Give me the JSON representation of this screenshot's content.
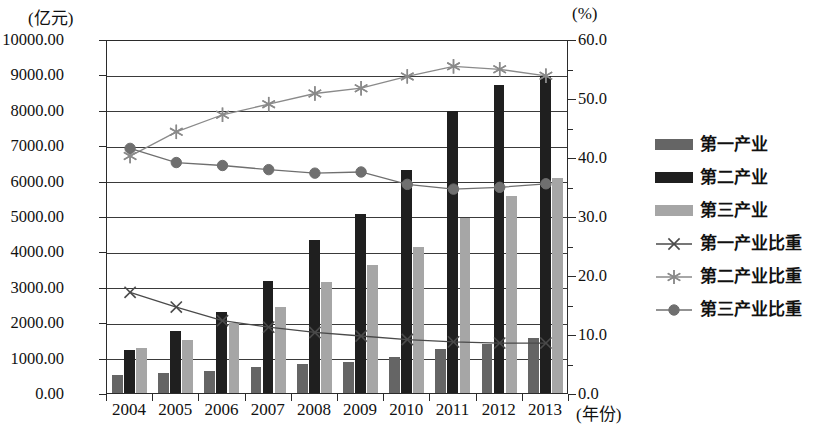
{
  "axes": {
    "left_unit": "(亿元)",
    "right_unit": "(%)",
    "x_caption": "(年份)",
    "left_ticks": [
      "10000.00",
      "9000.00",
      "8000.00",
      "7000.00",
      "6000.00",
      "5000.00",
      "4000.00",
      "3000.00",
      "2000.00",
      "1000.00",
      "0.00"
    ],
    "right_ticks": [
      "60.0",
      "50.0",
      "40.0",
      "30.0",
      "20.0",
      "10.0",
      "0.0"
    ]
  },
  "legend": {
    "position": "right",
    "items": [
      {
        "label": "第一产业",
        "kind": "bar",
        "color": "#656565",
        "icon": "bar-swatch-icon"
      },
      {
        "label": "第二产业",
        "kind": "bar",
        "color": "#1f1f1f",
        "icon": "bar-swatch-icon"
      },
      {
        "label": "第三产业",
        "kind": "bar",
        "color": "#a6a6a6",
        "icon": "bar-swatch-icon"
      },
      {
        "label": "第一产业比重",
        "kind": "line",
        "color": "#4a4a4a",
        "icon": "cross-marker-icon"
      },
      {
        "label": "第二产业比重",
        "kind": "line",
        "color": "#8a8a8a",
        "icon": "asterisk-marker-icon"
      },
      {
        "label": "第三产业比重",
        "kind": "line",
        "color": "#6f6f6f",
        "icon": "circle-marker-icon"
      }
    ]
  },
  "chart_data": {
    "type": "bar",
    "title": "",
    "subtitle": "",
    "xlabel": "(年份)",
    "ylabel": "(亿元)",
    "y2label": "(%)",
    "ylim": [
      0,
      10000
    ],
    "y2lim": [
      0,
      60
    ],
    "ytick_step": 1000,
    "y2tick_step": 10,
    "grid": true,
    "legend_position": "right",
    "categories": [
      "2004",
      "2005",
      "2006",
      "2007",
      "2008",
      "2009",
      "2010",
      "2011",
      "2012",
      "2013"
    ],
    "series": [
      {
        "name": "第一产业",
        "type": "bar",
        "axis": "left",
        "color": "#656565",
        "values": [
          500,
          570,
          610,
          740,
          830,
          890,
          1030,
          1250,
          1380,
          1550
        ]
      },
      {
        "name": "第二产业",
        "type": "bar",
        "axis": "left",
        "color": "#1f1f1f",
        "values": [
          1220,
          1740,
          2290,
          3160,
          4320,
          5060,
          6300,
          7970,
          8700,
          8950
        ]
      },
      {
        "name": "第三产业",
        "type": "bar",
        "axis": "left",
        "color": "#a6a6a6",
        "values": [
          1270,
          1500,
          1970,
          2420,
          3130,
          3630,
          4120,
          4930,
          5560,
          6060
        ]
      },
      {
        "name": "第一产业比重",
        "type": "line",
        "axis": "right",
        "color": "#4a4a4a",
        "marker": "x",
        "values": [
          17.4,
          14.9,
          12.6,
          11.5,
          10.6,
          10.0,
          9.4,
          9.0,
          8.8,
          8.8
        ]
      },
      {
        "name": "第二产业比重",
        "type": "line",
        "axis": "right",
        "color": "#8a8a8a",
        "marker": "asterisk",
        "values": [
          40.5,
          44.6,
          47.5,
          49.3,
          51.1,
          52.0,
          54.0,
          55.7,
          55.2,
          54.1
        ]
      },
      {
        "name": "第三产业比重",
        "type": "line",
        "axis": "right",
        "color": "#6f6f6f",
        "marker": "circle",
        "values": [
          41.8,
          39.4,
          38.9,
          38.2,
          37.6,
          37.8,
          35.7,
          34.9,
          35.2,
          35.8
        ]
      }
    ]
  }
}
